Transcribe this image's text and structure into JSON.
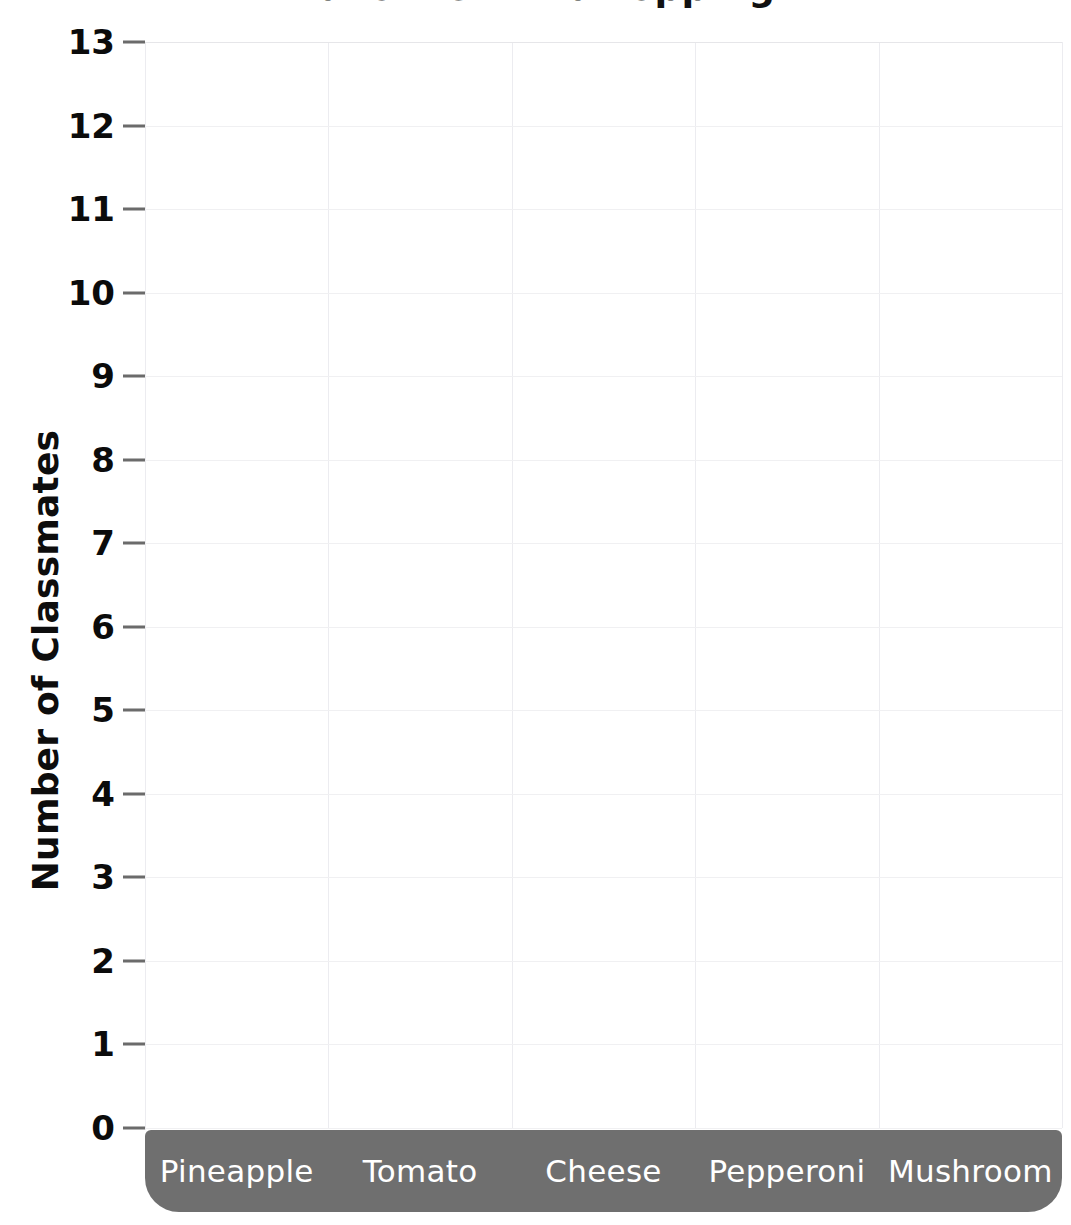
{
  "chart_data": {
    "type": "bar",
    "title": "Favorite Pizza Topping",
    "title_note": "Title is cropped at the top edge of the screenshot; only letter descenders are visible.",
    "xlabel": "",
    "ylabel": "Number of Classmates",
    "categories": [
      "Pineapple",
      "Tomato",
      "Cheese",
      "Pepperoni",
      "Mushroom"
    ],
    "values": [
      0,
      0,
      0,
      0,
      0
    ],
    "ylim": [
      0,
      13
    ],
    "ytick_labels": [
      "13",
      "12",
      "11",
      "10",
      "9",
      "8",
      "7",
      "6",
      "5",
      "4",
      "3",
      "2",
      "1",
      "0"
    ],
    "ytick_values": [
      13,
      12,
      11,
      10,
      9,
      8,
      7,
      6,
      5,
      4,
      3,
      2,
      1,
      0
    ],
    "grid": true,
    "legend": "none",
    "empty_template": true
  },
  "axes": {
    "y_title": "Number of Classmates"
  },
  "colors": {
    "category_bar_bg": "#6f6f6f",
    "category_label_text": "#ffffff",
    "gridline": "#ececf0",
    "tick_mark": "#6b6b6b",
    "axis_text": "#0b0b0b",
    "plot_background": "#ffffff"
  }
}
